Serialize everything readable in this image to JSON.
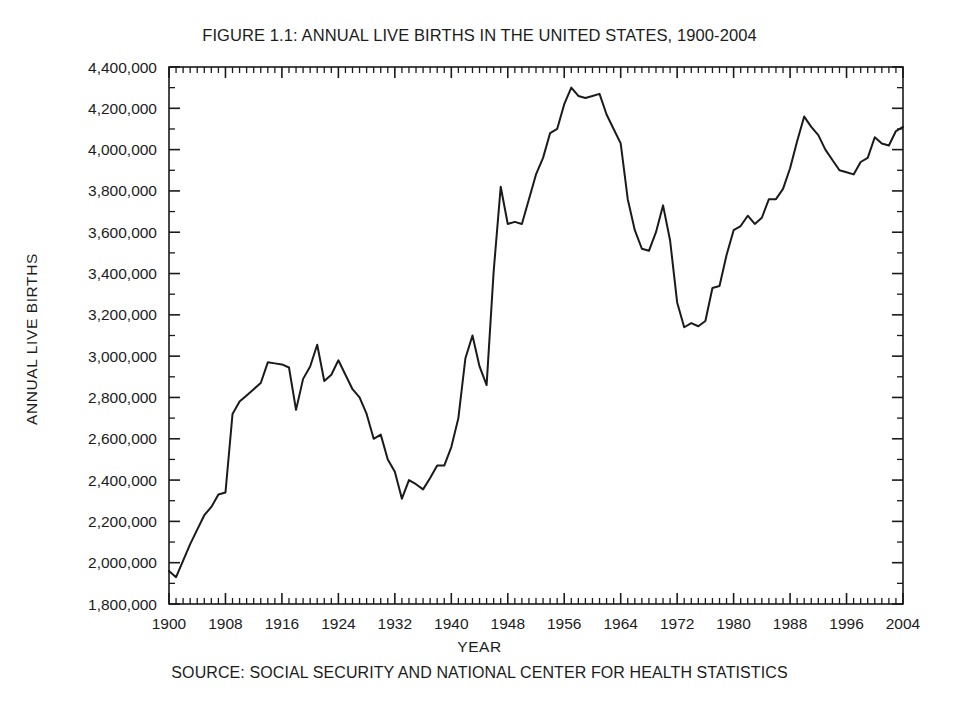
{
  "figure": {
    "title": "FIGURE 1.1: ANNUAL LIVE BIRTHS IN THE UNITED STATES, 1900-2004",
    "source_note": "SOURCE: SOCIAL SECURITY AND NATIONAL CENTER FOR HEALTH STATISTICS",
    "x_axis_title": "YEAR",
    "y_axis_title": "ANNUAL LIVE BIRTHS",
    "line_color": "#1a1a1a",
    "axis_color": "#1a1a1a",
    "background_color": "#ffffff"
  },
  "chart_data": {
    "type": "line",
    "title": "FIGURE 1.1: ANNUAL LIVE BIRTHS IN THE UNITED STATES, 1900-2004",
    "xlabel": "YEAR",
    "ylabel": "ANNUAL LIVE BIRTHS",
    "source": "SOURCE: SOCIAL SECURITY AND NATIONAL CENTER FOR HEALTH STATISTICS",
    "xlim": [
      1900,
      2004
    ],
    "ylim": [
      1800000,
      4400000
    ],
    "grid": false,
    "legend": "none",
    "x_major_tick_labels": [
      "1900",
      "1908",
      "1916",
      "1924",
      "1932",
      "1940",
      "1948",
      "1956",
      "1964",
      "1972",
      "1980",
      "1988",
      "1996",
      "2004"
    ],
    "x_major_tick_step": 8,
    "x_minor_tick_step": 1,
    "y_tick_labels": [
      "4,400,000",
      "4,200,000",
      "4,000,000",
      "3,800,000",
      "3,600,000",
      "3,400,000",
      "3,200,000",
      "3,000,000",
      "2,800,000",
      "2,600,000",
      "2,400,000",
      "2,200,000",
      "2,000,000",
      "1,800,000"
    ],
    "y_tick_values": [
      4400000,
      4200000,
      4000000,
      3800000,
      3600000,
      3400000,
      3200000,
      3000000,
      2800000,
      2600000,
      2400000,
      2200000,
      2000000,
      1800000
    ],
    "y_minor_tick_step": 100000,
    "series": [
      {
        "name": "Annual live births",
        "x": [
          1900,
          1901,
          1902,
          1903,
          1904,
          1905,
          1906,
          1907,
          1908,
          1909,
          1910,
          1911,
          1912,
          1913,
          1914,
          1915,
          1916,
          1917,
          1918,
          1919,
          1920,
          1921,
          1922,
          1923,
          1924,
          1925,
          1926,
          1927,
          1928,
          1929,
          1930,
          1931,
          1932,
          1933,
          1934,
          1935,
          1936,
          1937,
          1938,
          1939,
          1940,
          1941,
          1942,
          1943,
          1944,
          1945,
          1946,
          1947,
          1948,
          1949,
          1950,
          1951,
          1952,
          1953,
          1954,
          1955,
          1956,
          1957,
          1958,
          1959,
          1960,
          1961,
          1962,
          1963,
          1964,
          1965,
          1966,
          1967,
          1968,
          1969,
          1970,
          1971,
          1972,
          1973,
          1974,
          1975,
          1976,
          1977,
          1978,
          1979,
          1980,
          1981,
          1982,
          1983,
          1984,
          1985,
          1986,
          1987,
          1988,
          1989,
          1990,
          1991,
          1992,
          1993,
          1994,
          1995,
          1996,
          1997,
          1998,
          1999,
          2000,
          2001,
          2002,
          2003,
          2004
        ],
        "values": [
          1960000,
          1930000,
          2010000,
          2090000,
          2160000,
          2230000,
          2270000,
          2330000,
          2340000,
          2720000,
          2780000,
          2810000,
          2840000,
          2870000,
          2970000,
          2965000,
          2960000,
          2945000,
          2740000,
          2890000,
          2950000,
          3055000,
          2880000,
          2910000,
          2980000,
          2910000,
          2840000,
          2800000,
          2720000,
          2600000,
          2620000,
          2500000,
          2440000,
          2310000,
          2400000,
          2380000,
          2355000,
          2410000,
          2470000,
          2470000,
          2560000,
          2700000,
          2990000,
          3100000,
          2950000,
          2860000,
          3410000,
          3820000,
          3640000,
          3650000,
          3640000,
          3760000,
          3880000,
          3960000,
          4080000,
          4100000,
          4220000,
          4300000,
          4260000,
          4250000,
          4260000,
          4270000,
          4170000,
          4100000,
          4030000,
          3760000,
          3610000,
          3520000,
          3510000,
          3600000,
          3730000,
          3560000,
          3260000,
          3140000,
          3160000,
          3145000,
          3170000,
          3330000,
          3340000,
          3490000,
          3610000,
          3630000,
          3680000,
          3640000,
          3670000,
          3760000,
          3760000,
          3810000,
          3910000,
          4040000,
          4160000,
          4110000,
          4070000,
          4000000,
          3950000,
          3900000,
          3890000,
          3880000,
          3940000,
          3960000,
          4060000,
          4030000,
          4020000,
          4090000,
          4110000
        ]
      }
    ]
  }
}
